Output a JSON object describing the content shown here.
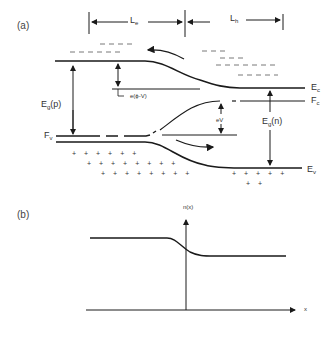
{
  "panel_a": {
    "label": "(a)",
    "Le": {
      "main": "L",
      "sub": "e"
    },
    "Lh": {
      "main": "L",
      "sub": "h"
    },
    "Ec": {
      "main": "E",
      "sub": "c"
    },
    "Fc": {
      "main": "F",
      "sub": "c"
    },
    "Fv": {
      "main": "F",
      "sub": "v"
    },
    "Ev": {
      "main": "E",
      "sub": "v"
    },
    "Egp": {
      "main": "E",
      "sub": "g",
      "suffix": "(p)"
    },
    "Egn": {
      "main": "E",
      "sub": "g",
      "suffix": "(n)"
    },
    "barrier": "e(ϕ-V)",
    "eV": "eV",
    "holes_row1": "+ + + + + +",
    "holes_row2": "+ + + + + + + +",
    "holes_row3": "+ + + + + + + +",
    "holes_n_row1": "+ + + + +",
    "holes_n_row2": "+ +"
  },
  "panel_b": {
    "label": "(b)",
    "y_axis_label": "n(x)",
    "x_axis_label": "x"
  },
  "colors": {
    "line": "#1a1a1a",
    "text": "#333333",
    "background": "#ffffff"
  }
}
